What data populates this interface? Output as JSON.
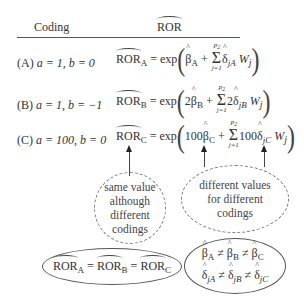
{
  "header": {
    "col_coding": "Coding",
    "col_ror": "ROR"
  },
  "rows": [
    {
      "label": "(A)",
      "coding": "a = 1, b = 0",
      "lhs": "ROR",
      "lhs_sub": "A",
      "eq": "= exp",
      "beta_coef": "",
      "beta_sub": "A",
      "sum_upper": "p2",
      "sum_lower": "j=1",
      "delta_coef": "",
      "delta_sub": "jA",
      "w": "Wj"
    },
    {
      "label": "(B)",
      "coding": "a = 1, b = −1",
      "lhs": "ROR",
      "lhs_sub": "B",
      "eq": "= exp",
      "beta_coef": "2",
      "beta_sub": "B",
      "sum_upper": "p2",
      "sum_lower": "j=1",
      "delta_coef": "2",
      "delta_sub": "jB",
      "w": "Wj"
    },
    {
      "label": "(C)",
      "coding": "a = 100, b = 0",
      "lhs": "ROR",
      "lhs_sub": "C",
      "eq": "= exp",
      "beta_coef": "100",
      "beta_sub": "C",
      "sum_upper": "p2",
      "sum_lower": "j=1",
      "delta_coef": "100",
      "delta_sub": "jC",
      "w": "Wj"
    }
  ],
  "notes": {
    "same": [
      "same value",
      "although",
      "different",
      "codings"
    ],
    "different": [
      "different values",
      "for different",
      "codings"
    ]
  },
  "summary": {
    "left": "RORA = RORB = RORC",
    "right_line1": "βA ≠ βB ≠ βC",
    "right_line2": "δjA ≠ δjB ≠ δjC"
  }
}
